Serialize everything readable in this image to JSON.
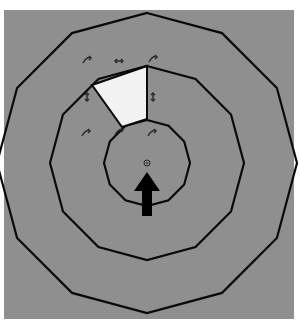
{
  "diagram": {
    "type": "concentric-polygons",
    "background_color": "#8f8f8f",
    "stroke_color": "#0a0a0a",
    "center": [
      147,
      163
    ],
    "sides": 12,
    "rings": [
      {
        "name": "outer-ring",
        "radius": 150
      },
      {
        "name": "middle-ring",
        "radius": 97
      },
      {
        "name": "inner-ring",
        "radius": 43
      }
    ],
    "highlighted_sector": {
      "fill": "#f2f2f2",
      "polygon": [
        [
          92,
          85
        ],
        [
          147,
          66
        ],
        [
          147,
          119
        ],
        [
          122,
          127
        ]
      ]
    },
    "center_marker": {
      "shape": "circle-dot",
      "position": [
        147,
        163
      ],
      "radius": 3
    },
    "arrow": {
      "direction": "up",
      "color": "#000000",
      "tip": [
        147,
        172
      ],
      "base_y": 216
    },
    "small_arrows": [
      {
        "position": [
          87,
          60
        ],
        "glyph": "curved-arrow"
      },
      {
        "position": [
          119,
          61
        ],
        "glyph": "double-arrow-horizontal"
      },
      {
        "position": [
          153,
          59
        ],
        "glyph": "curved-arrow"
      },
      {
        "position": [
          153,
          97
        ],
        "glyph": "double-arrow-vertical"
      },
      {
        "position": [
          87,
          97
        ],
        "glyph": "double-arrow-vertical"
      },
      {
        "position": [
          86,
          133
        ],
        "glyph": "curved-arrow"
      },
      {
        "position": [
          119,
          132
        ],
        "glyph": "curved-arrow"
      },
      {
        "position": [
          152,
          133
        ],
        "glyph": "curved-arrow"
      }
    ]
  }
}
